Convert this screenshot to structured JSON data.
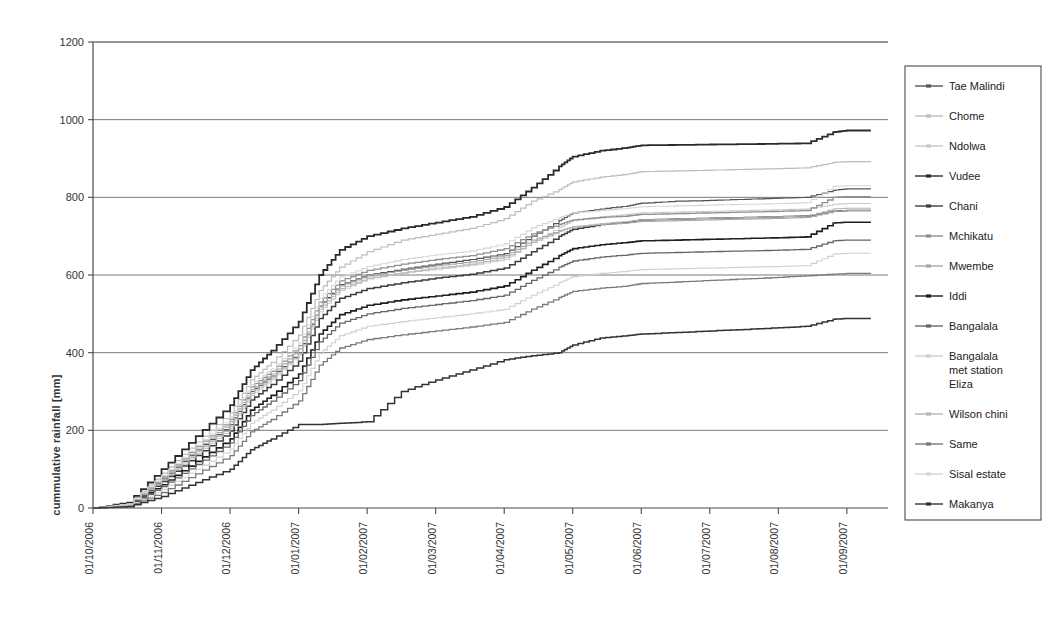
{
  "chart_data": {
    "type": "line",
    "title": "",
    "xlabel": "",
    "ylabel": "cummulative rainfall [mm]",
    "ylim": [
      0,
      1200
    ],
    "yticks": [
      0,
      200,
      400,
      600,
      800,
      1000,
      1200
    ],
    "grid": "horizontal",
    "legend_position": "right",
    "x_type": "date",
    "x_tick_labels": [
      "01/10/2006",
      "01/11/2006",
      "01/12/2006",
      "01/01/2007",
      "01/02/2007",
      "01/03/2007",
      "01/04/2007",
      "01/05/2007",
      "01/06/2007",
      "01/07/2007",
      "01/08/2007",
      "01/09/2007"
    ],
    "x": [
      0,
      0.5,
      1,
      1.5,
      2,
      2.3,
      2.6,
      3,
      3.3,
      3.6,
      4,
      4.5,
      5,
      5.5,
      6,
      6.4,
      6.8,
      7,
      7.4,
      7.8,
      8,
      8.5,
      9,
      9.5,
      10,
      10.4,
      10.8,
      11,
      11.35
    ],
    "series": [
      {
        "name": "Tae Malindi",
        "color": "#555555",
        "width": 1.2,
        "values": [
          0,
          10,
          75,
          150,
          215,
          300,
          340,
          400,
          520,
          575,
          600,
          615,
          628,
          640,
          655,
          700,
          740,
          760,
          770,
          778,
          785,
          790,
          792,
          795,
          798,
          800,
          818,
          822,
          822
        ]
      },
      {
        "name": "Chome",
        "color": "#bdbdbd",
        "width": 1.2,
        "values": [
          0,
          12,
          90,
          170,
          245,
          330,
          375,
          445,
          560,
          620,
          660,
          690,
          705,
          720,
          745,
          790,
          820,
          840,
          852,
          860,
          866,
          868,
          870,
          872,
          874,
          876,
          890,
          892,
          892
        ]
      },
      {
        "name": "Ndolwa",
        "color": "#c9c9c9",
        "width": 1.1,
        "values": [
          0,
          8,
          70,
          140,
          205,
          290,
          330,
          395,
          505,
          560,
          590,
          605,
          615,
          625,
          640,
          685,
          722,
          740,
          750,
          756,
          760,
          762,
          764,
          766,
          768,
          770,
          782,
          784,
          784
        ]
      },
      {
        "name": "Vudee",
        "color": "#2b2b2b",
        "width": 1.8,
        "values": [
          0,
          14,
          100,
          185,
          265,
          355,
          405,
          480,
          600,
          665,
          700,
          720,
          735,
          750,
          775,
          825,
          880,
          905,
          920,
          928,
          934,
          935,
          936,
          937,
          938,
          939,
          968,
          972,
          972
        ]
      },
      {
        "name": "Chani",
        "color": "#3d3d3d",
        "width": 1.5,
        "values": [
          0,
          9,
          68,
          135,
          198,
          278,
          318,
          378,
          488,
          540,
          565,
          580,
          592,
          602,
          618,
          660,
          700,
          718,
          730,
          736,
          742,
          744,
          746,
          748,
          750,
          752,
          764,
          766,
          766
        ]
      },
      {
        "name": "Mchikatu",
        "color": "#8f8f8f",
        "width": 1.3,
        "values": [
          0,
          11,
          80,
          158,
          228,
          312,
          352,
          418,
          530,
          585,
          612,
          628,
          640,
          650,
          668,
          706,
          730,
          742,
          748,
          752,
          756,
          758,
          760,
          762,
          764,
          766,
          800,
          802,
          802
        ]
      },
      {
        "name": "Mwembe",
        "color": "#a8a8a8",
        "width": 1.2,
        "values": [
          0,
          10,
          78,
          152,
          222,
          305,
          345,
          410,
          518,
          572,
          598,
          612,
          624,
          634,
          650,
          690,
          714,
          724,
          730,
          734,
          738,
          740,
          742,
          744,
          746,
          748,
          764,
          766,
          766
        ]
      },
      {
        "name": "Iddi",
        "color": "#1f1f1f",
        "width": 1.6,
        "values": [
          0,
          7,
          60,
          120,
          178,
          252,
          290,
          345,
          448,
          498,
          522,
          536,
          546,
          556,
          572,
          612,
          650,
          668,
          678,
          684,
          688,
          690,
          692,
          694,
          696,
          698,
          734,
          736,
          736
        ]
      },
      {
        "name": "Bangalala",
        "color": "#666666",
        "width": 1.3,
        "values": [
          0,
          6,
          55,
          112,
          168,
          238,
          275,
          328,
          428,
          476,
          500,
          514,
          524,
          534,
          548,
          586,
          620,
          636,
          646,
          652,
          656,
          658,
          660,
          662,
          664,
          666,
          688,
          690,
          690
        ]
      },
      {
        "name": "Bangalala met station Eliza",
        "color": "#cfcfcf",
        "width": 1.1,
        "values": [
          0,
          5,
          48,
          100,
          152,
          218,
          252,
          302,
          398,
          444,
          468,
          480,
          490,
          500,
          512,
          548,
          580,
          596,
          604,
          610,
          614,
          616,
          618,
          620,
          622,
          624,
          654,
          656,
          656
        ]
      },
      {
        "name": "Wilson chini",
        "color": "#b5b5b5",
        "width": 1.1,
        "values": [
          0,
          9,
          72,
          145,
          210,
          295,
          335,
          398,
          512,
          565,
          592,
          606,
          618,
          628,
          645,
          684,
          712,
          724,
          732,
          738,
          742,
          744,
          746,
          748,
          750,
          752,
          770,
          772,
          772
        ]
      },
      {
        "name": "Same",
        "color": "#7a7a7a",
        "width": 1.3,
        "values": [
          0,
          4,
          40,
          88,
          135,
          196,
          228,
          276,
          368,
          412,
          434,
          446,
          456,
          466,
          478,
          512,
          542,
          558,
          566,
          572,
          578,
          582,
          586,
          590,
          594,
          598,
          602,
          604,
          604
        ]
      },
      {
        "name": "Sisal estate",
        "color": "#d5d5d5",
        "width": 1.1,
        "values": [
          0,
          10,
          84,
          162,
          234,
          318,
          358,
          425,
          540,
          595,
          622,
          640,
          652,
          662,
          680,
          722,
          748,
          760,
          766,
          772,
          776,
          778,
          780,
          782,
          784,
          786,
          828,
          830,
          830
        ]
      },
      {
        "name": "Makanya",
        "color": "#333333",
        "width": 1.5,
        "values": [
          0,
          3,
          30,
          66,
          100,
          150,
          178,
          215,
          215,
          218,
          222,
          300,
          330,
          355,
          382,
          392,
          400,
          420,
          438,
          444,
          448,
          452,
          456,
          460,
          464,
          468,
          486,
          488,
          488
        ]
      }
    ]
  },
  "legend": {
    "items": [
      {
        "label": "Tae Malindi"
      },
      {
        "label": "Chome"
      },
      {
        "label": "Ndolwa"
      },
      {
        "label": "Vudee"
      },
      {
        "label": "Chani"
      },
      {
        "label": "Mchikatu"
      },
      {
        "label": "Mwembe"
      },
      {
        "label": "Iddi"
      },
      {
        "label": "Bangalala"
      },
      {
        "label": "Bangalala met station Eliza"
      },
      {
        "label": "Wilson chini"
      },
      {
        "label": "Same"
      },
      {
        "label": "Sisal estate"
      },
      {
        "label": "Makanya"
      }
    ]
  }
}
